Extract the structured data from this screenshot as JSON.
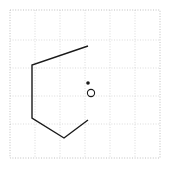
{
  "figure": {
    "title": "",
    "width": 170,
    "height": 170,
    "background_color": "#ffffff"
  },
  "plot_area": {
    "x": 10,
    "y": 10,
    "width": 150,
    "height": 148,
    "border_style": "dotted",
    "border_color": "#b0b0b0",
    "grid_visible": true,
    "grid_color": "#cccccc",
    "grid_style": "dotted",
    "grid_x_lines": [
      35,
      60,
      85,
      110,
      135
    ],
    "grid_y_lines": [
      40,
      68,
      96,
      124
    ]
  },
  "chart_data": {
    "type": "scatter",
    "title": "",
    "xlabel": "",
    "ylabel": "",
    "xlim": [
      10,
      160
    ],
    "ylim": [
      158,
      10
    ],
    "grid": true,
    "legend": "none",
    "shapes": [
      {
        "name": "open-polyline",
        "kind": "polyline",
        "closed": false,
        "stroke_color": "#1a1a1a",
        "stroke_width": 1.4,
        "fill": "none",
        "points": [
          [
            88,
            46
          ],
          [
            32,
            65
          ],
          [
            32,
            118
          ],
          [
            64,
            138
          ],
          [
            88,
            120
          ]
        ]
      }
    ],
    "markers": [
      {
        "name": "filled-point",
        "kind": "dot",
        "filled": true,
        "x": 88,
        "y": 83,
        "radius": 1.8,
        "color": "#1a1a1a"
      },
      {
        "name": "open-point",
        "kind": "circle",
        "filled": false,
        "x": 91,
        "y": 93,
        "radius": 3.6,
        "color": "#1a1a1a"
      }
    ],
    "tick_labels": {
      "x": [],
      "y": []
    },
    "annotations": []
  }
}
